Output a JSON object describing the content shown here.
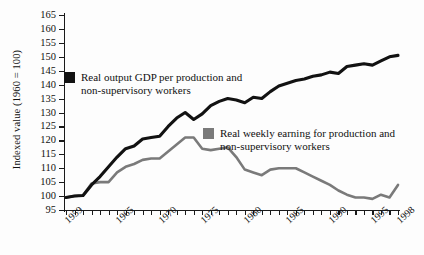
{
  "axes": {
    "y_title": "Indexed value (1960 = 100)",
    "y_ticks": [
      165,
      160,
      155,
      150,
      145,
      140,
      135,
      130,
      125,
      120,
      115,
      110,
      105,
      100,
      95
    ],
    "x_labels": [
      "1959",
      "1965",
      "1970",
      "1975",
      "1980",
      "1985",
      "1990",
      "1995",
      "1998"
    ]
  },
  "legend": {
    "gdp_label": "Real output GDP per production and\nnon-supervisory workers",
    "gdp_color": "#121212",
    "wages_label": "Real weekly earning for production and\nnon-supervisory workers",
    "wages_color": "#7a7a7a"
  },
  "chart_data": {
    "type": "line",
    "title": "",
    "xlabel": "",
    "ylabel": "Indexed value (1960 = 100)",
    "ylim": [
      95,
      165
    ],
    "xlim": [
      1959,
      1998
    ],
    "grid": false,
    "legend_position": "inside",
    "x": [
      1959,
      1960,
      1961,
      1962,
      1963,
      1964,
      1965,
      1966,
      1967,
      1968,
      1969,
      1970,
      1971,
      1972,
      1973,
      1974,
      1975,
      1976,
      1977,
      1978,
      1979,
      1980,
      1981,
      1982,
      1983,
      1984,
      1985,
      1986,
      1987,
      1988,
      1989,
      1990,
      1991,
      1992,
      1993,
      1994,
      1995,
      1996,
      1997,
      1998
    ],
    "series": [
      {
        "name": "Real output GDP per production and non-supervisory workers",
        "color": "#121212",
        "values": [
          99.5,
          100.0,
          100.2,
          104.0,
          107.0,
          110.5,
          114.0,
          117.0,
          118.0,
          120.5,
          121.0,
          121.5,
          125.0,
          128.0,
          130.0,
          127.5,
          129.5,
          132.5,
          134.0,
          135.0,
          134.5,
          133.5,
          135.5,
          135.0,
          137.5,
          139.5,
          140.5,
          141.5,
          142.0,
          143.0,
          143.5,
          144.5,
          144.0,
          146.5,
          147.0,
          147.5,
          147.0,
          148.5,
          150.0,
          150.5
        ]
      },
      {
        "name": "Real weekly earning for production and non-supervisory workers",
        "color": "#7a7a7a",
        "values": [
          99.5,
          100.0,
          100.2,
          104.5,
          105.0,
          105.0,
          108.5,
          110.5,
          111.5,
          113.0,
          113.5,
          113.5,
          116.0,
          118.5,
          121.0,
          121.0,
          117.0,
          116.5,
          117.0,
          117.5,
          114.0,
          109.5,
          108.5,
          107.5,
          109.5,
          110.0,
          110.0,
          110.0,
          108.5,
          107.0,
          105.5,
          104.0,
          102.0,
          100.5,
          99.5,
          99.5,
          99.0,
          100.5,
          99.5,
          104.0
        ]
      }
    ]
  }
}
